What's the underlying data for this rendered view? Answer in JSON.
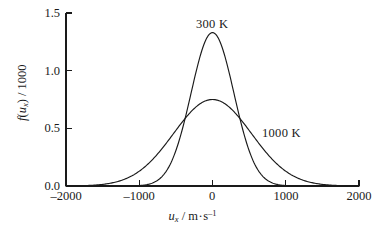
{
  "chart_data": {
    "type": "line",
    "title": "",
    "xlabel_parts": {
      "symbol": "u",
      "subscript": "x",
      "separator": " / ",
      "unit": "m·s",
      "unit_exponent": "–1"
    },
    "xlabel": "u_x / m·s^-1",
    "ylabel_parts": {
      "symbol": "f",
      "open": "(",
      "arg": "u",
      "arg_subscript": "x",
      "close": ")",
      "separator": " / ",
      "scale": "1000"
    },
    "ylabel": "f(u_x) / 1000",
    "xlim": [
      -2000,
      2000
    ],
    "ylim": [
      0.0,
      1.5
    ],
    "xticks": [
      -2000,
      -1000,
      0,
      1000,
      2000
    ],
    "xtick_labels": [
      "–2000",
      "–1000",
      "0",
      "1000",
      "2000"
    ],
    "yticks": [
      0.0,
      0.5,
      1.0,
      1.5
    ],
    "ytick_labels": [
      "0.0",
      "0.5",
      "1.0",
      "1.5"
    ],
    "grid": false,
    "legend_position": "inline-annotation",
    "annotations": [
      {
        "text": "300 K",
        "x": 40,
        "y": 1.46
      },
      {
        "text": "1000 K",
        "x": 760,
        "y": 0.53
      }
    ],
    "series": [
      {
        "name": "300 K",
        "peak_value": 1.33,
        "peak_x": 0,
        "sigma": 292,
        "x": [
          -2000,
          -1800,
          -1600,
          -1400,
          -1200,
          -1000,
          -900,
          -800,
          -700,
          -600,
          -500,
          -400,
          -300,
          -200,
          -100,
          0,
          100,
          200,
          300,
          400,
          500,
          600,
          700,
          800,
          900,
          1000,
          1200,
          1400,
          1600,
          1800,
          2000
        ],
        "y": [
          0.0,
          0.0,
          0.0,
          0.0,
          0.0,
          0.001,
          0.003,
          0.009,
          0.031,
          0.085,
          0.206,
          0.433,
          0.789,
          1.125,
          1.313,
          1.33,
          1.313,
          1.125,
          0.789,
          0.433,
          0.206,
          0.085,
          0.031,
          0.009,
          0.003,
          0.001,
          0.0,
          0.0,
          0.0,
          0.0,
          0.0
        ]
      },
      {
        "name": "1000 K",
        "peak_value": 0.75,
        "peak_x": 0,
        "sigma": 532,
        "x": [
          -2000,
          -1800,
          -1600,
          -1400,
          -1200,
          -1000,
          -900,
          -800,
          -700,
          -600,
          -500,
          -400,
          -300,
          -200,
          -100,
          0,
          100,
          200,
          300,
          400,
          500,
          600,
          700,
          800,
          900,
          1000,
          1200,
          1400,
          1600,
          1800,
          2000
        ],
        "y": [
          0.002,
          0.008,
          0.026,
          0.07,
          0.154,
          0.284,
          0.361,
          0.437,
          0.506,
          0.567,
          0.622,
          0.67,
          0.707,
          0.733,
          0.746,
          0.75,
          0.746,
          0.733,
          0.707,
          0.67,
          0.622,
          0.567,
          0.506,
          0.437,
          0.361,
          0.284,
          0.154,
          0.07,
          0.026,
          0.008,
          0.002
        ]
      }
    ],
    "crossings": [
      -600,
      600
    ],
    "axis_style": {
      "spines": [
        "left",
        "bottom"
      ],
      "tick_direction": "in",
      "line_color": "#1a1a1a"
    }
  },
  "ytick_labels": [
    "1.5",
    "1.0",
    "0.5",
    "0.0"
  ],
  "xtick_labels": [
    "–2000",
    "–1000",
    "0",
    "1000",
    "2000"
  ],
  "annotations": {
    "label_300k": "300 K",
    "label_1000k": "1000 K"
  },
  "ylabel": {
    "symbol": "f",
    "open": "(",
    "arg": "u",
    "sub": "x",
    "close": ")",
    "sep": " / ",
    "scale": "1000"
  },
  "xlabel": {
    "symbol": "u",
    "sub": "x",
    "sep": " / ",
    "unit": "m",
    "dot": "·",
    "unit2": "s",
    "exp": "–1"
  },
  "colors": {
    "line": "#1a1a1a",
    "axis": "#1a1a1a",
    "background": "#ffffff"
  }
}
